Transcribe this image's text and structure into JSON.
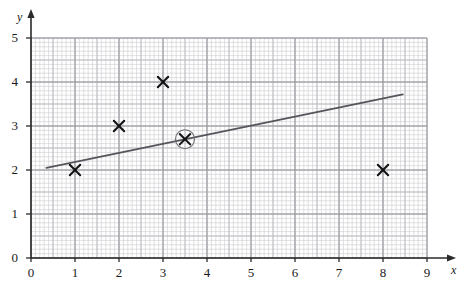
{
  "chart_data": {
    "type": "scatter",
    "title": "",
    "subtitle": "",
    "xlabel": "x",
    "ylabel": "y",
    "xlim": [
      0,
      9
    ],
    "ylim": [
      0,
      5
    ],
    "xticks": [
      "0",
      "1",
      "2",
      "3",
      "4",
      "5",
      "6",
      "7",
      "8",
      "9"
    ],
    "yticks": [
      "0",
      "1",
      "2",
      "3",
      "4",
      "5"
    ],
    "grid": true,
    "grid_minor_step": 0.1,
    "grid_major_step": 1,
    "legend": null,
    "points": [
      {
        "x": 1,
        "y": 2,
        "marker": "x",
        "circled": false
      },
      {
        "x": 2,
        "y": 3,
        "marker": "x",
        "circled": false
      },
      {
        "x": 3,
        "y": 4,
        "marker": "x",
        "circled": false
      },
      {
        "x": 3.5,
        "y": 2.7,
        "marker": "x",
        "circled": true
      },
      {
        "x": 8,
        "y": 2,
        "marker": "x",
        "circled": false
      }
    ],
    "series": [
      {
        "name": "line of best fit",
        "type": "line",
        "x": [
          0.35,
          8.45
        ],
        "y": [
          2.05,
          3.72
        ]
      }
    ],
    "annotations": []
  },
  "axes": {
    "x_name": "x",
    "y_name": "y"
  },
  "colors": {
    "grid_minor": "#d3d3d6",
    "grid_major": "#9a9aa0",
    "axis": "#2a2a2a",
    "line": "#55555c",
    "marker": "#111111",
    "background": "#ffffff"
  }
}
